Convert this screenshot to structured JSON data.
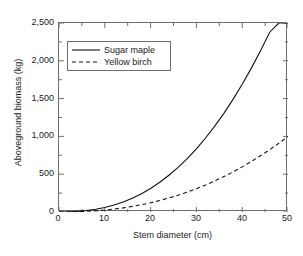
{
  "chart_data": {
    "type": "line",
    "title": "",
    "xlabel": "Stem diameter (cm)",
    "ylabel": "Aboveground biomass (kg)",
    "xlim": [
      0,
      50
    ],
    "ylim": [
      0,
      2500
    ],
    "xticks": [
      0,
      10,
      20,
      30,
      40,
      50
    ],
    "xtick_labels": [
      "0",
      "10",
      "20",
      "30",
      "40",
      "50"
    ],
    "yticks": [
      0,
      500,
      1000,
      1500,
      2000,
      2500
    ],
    "ytick_labels": [
      "0",
      "500",
      "1,000",
      "1,500",
      "2,000",
      "2,500"
    ],
    "xminor_ticks": [
      5,
      15,
      25,
      35,
      45
    ],
    "yminor_ticks": [
      250,
      750,
      1250,
      1750,
      2250
    ],
    "grid": false,
    "legend_position": "upper left",
    "x": [
      0,
      2,
      4,
      6,
      8,
      10,
      12,
      14,
      16,
      18,
      20,
      22,
      24,
      26,
      28,
      30,
      32,
      34,
      36,
      38,
      40,
      42,
      44,
      46,
      48,
      50
    ],
    "series": [
      {
        "name": "Sugar maple",
        "line_style": "solid",
        "color": "#111111",
        "values": [
          0,
          2,
          8,
          19,
          36,
          60,
          92,
          133,
          182,
          242,
          312,
          393,
          486,
          590,
          707,
          836,
          979,
          1135,
          1305,
          1490,
          1689,
          1903,
          2133,
          2378,
          2640,
          2918
        ]
      },
      {
        "name": "Yellow birch",
        "line_style": "dashed",
        "color": "#111111",
        "values": [
          0,
          1,
          4,
          9,
          16,
          26,
          39,
          55,
          74,
          96,
          122,
          152,
          185,
          222,
          263,
          308,
          357,
          411,
          468,
          530,
          597,
          668,
          744,
          824,
          909,
          999
        ]
      }
    ],
    "annotations": []
  },
  "legend": {
    "entries": [
      {
        "label": "Sugar maple",
        "style": "solid"
      },
      {
        "label": "Yellow birch",
        "style": "dashed"
      }
    ]
  },
  "axes": {
    "x_title": "Stem diameter (cm)",
    "y_title": "Aboveground biomass (kg)"
  }
}
